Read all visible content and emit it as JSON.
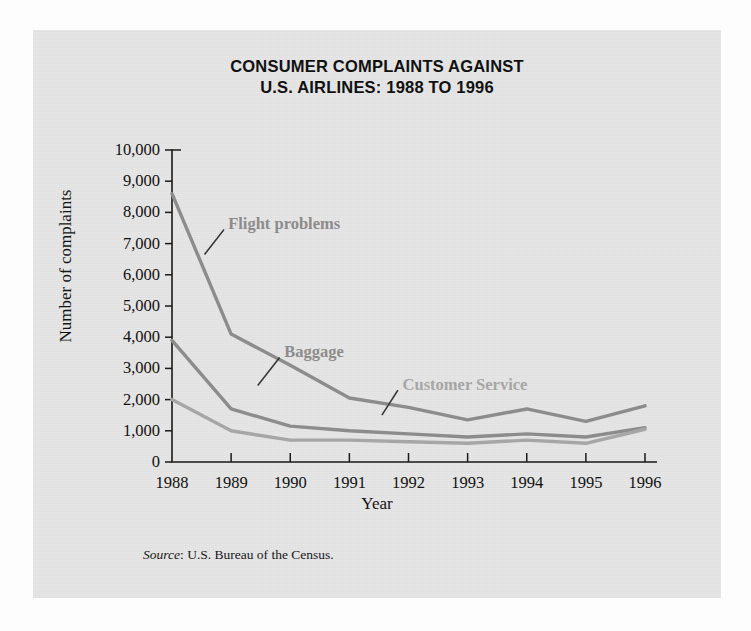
{
  "figure": {
    "title_line1": "CONSUMER COMPLAINTS AGAINST",
    "title_line2": "U.S. AIRLINES: 1988 TO 1996",
    "source_word": "Source",
    "source_rest": ": U.S. Bureau of the Census.",
    "background_color": "#e6e6e6",
    "page_color": "#fdfdfd"
  },
  "chart_data": {
    "type": "line",
    "title": "CONSUMER COMPLAINTS AGAINST U.S. AIRLINES: 1988 TO 1996",
    "xlabel": "Year",
    "ylabel": "Number of complaints",
    "categories": [
      "1988",
      "1989",
      "1990",
      "1991",
      "1992",
      "1993",
      "1994",
      "1995",
      "1996"
    ],
    "x": [
      1988,
      1989,
      1990,
      1991,
      1992,
      1993,
      1994,
      1995,
      1996
    ],
    "ylim": [
      0,
      10000
    ],
    "ytick_values": [
      0,
      1000,
      2000,
      3000,
      4000,
      5000,
      6000,
      7000,
      8000,
      9000,
      10000
    ],
    "ytick_labels": [
      "0",
      "1,000",
      "2,000",
      "3,000",
      "4,000",
      "5,000",
      "6,000",
      "7,000",
      "8,000",
      "9,000",
      "10,000"
    ],
    "grid": false,
    "legend": "inline-annotations",
    "series": [
      {
        "name": "Flight problems",
        "color": "#8c8c8c",
        "label_x": 1988.95,
        "label_y": 7600,
        "leader_from": [
          1988.55,
          6650
        ],
        "leader_to": [
          1988.88,
          7450
        ],
        "values": [
          8600,
          4100,
          3100,
          2050,
          1750,
          1350,
          1700,
          1300,
          1800
        ]
      },
      {
        "name": "Baggage",
        "color": "#8c8c8c",
        "label_x": 1989.9,
        "label_y": 3500,
        "leader_from": [
          1989.45,
          2450
        ],
        "leader_to": [
          1989.82,
          3350
        ],
        "values": [
          3900,
          1700,
          1150,
          1000,
          900,
          800,
          900,
          800,
          1100
        ]
      },
      {
        "name": "Customer Service",
        "color": "#a6a6a6",
        "label_x": 1991.9,
        "label_y": 2450,
        "leader_from": [
          1991.55,
          1500
        ],
        "leader_to": [
          1991.82,
          2300
        ],
        "values": [
          2000,
          1000,
          700,
          700,
          650,
          600,
          700,
          600,
          1050
        ]
      }
    ]
  }
}
